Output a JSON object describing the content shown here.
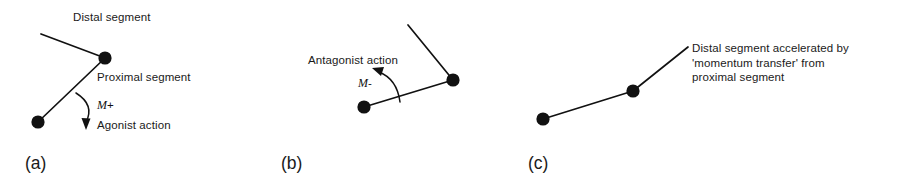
{
  "figure": {
    "background_color": "#ffffff",
    "ink_color": "#111111",
    "text_color": "#1a1a1a"
  },
  "panels": [
    {
      "id": "a",
      "label": "(a)",
      "annotations": {
        "distal": "Distal segment",
        "proximal": "Proximal segment",
        "moment_symbol": "M",
        "moment_sign": "+",
        "action": "Agonist action"
      },
      "diagram": {
        "type": "two-segment-linkage",
        "distal_segment_end": [
          41,
          34
        ],
        "joint": [
          105,
          58
        ],
        "proximal_segment_end": [
          38,
          122
        ],
        "dot_radius": 6.5,
        "line_width": 1.6,
        "moment_arrow": {
          "start": [
            78,
            95
          ],
          "control": [
            95,
            104
          ],
          "end": [
            88,
            126
          ],
          "direction": "clockwise-downward"
        }
      }
    },
    {
      "id": "b",
      "label": "(b)",
      "annotations": {
        "action": "Antagonist action",
        "moment_symbol": "M",
        "moment_sign": "-"
      },
      "diagram": {
        "type": "two-segment-linkage",
        "distal_segment_end": [
          408,
          25
        ],
        "joint": [
          453,
          80
        ],
        "proximal_segment_end": [
          364,
          107
        ],
        "dot_radius": 6.5,
        "line_width": 1.6,
        "moment_arrow": {
          "start": [
            399,
            101
          ],
          "control": [
            395,
            78
          ],
          "end": [
            376,
            70
          ],
          "direction": "counter-clockwise-upward"
        }
      }
    },
    {
      "id": "c",
      "label": "(c)",
      "annotations": {
        "caption_line_1": "Distal segment accelerated by",
        "caption_line_2": "'momentum transfer' from",
        "caption_line_3": "proximal segment"
      },
      "diagram": {
        "type": "two-segment-linkage-extended",
        "distal_segment_end": [
          688,
          47
        ],
        "joint": [
          633,
          91
        ],
        "proximal_segment_end": [
          543,
          119
        ],
        "dot_radius": 6.5,
        "line_width": 1.6,
        "moment_arrow": null
      }
    }
  ]
}
